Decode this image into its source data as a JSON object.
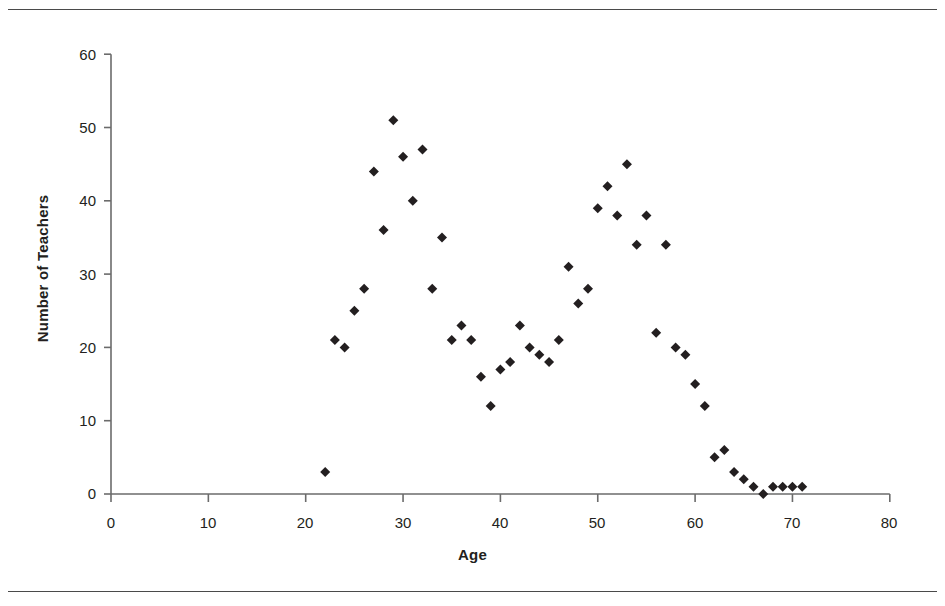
{
  "chart_data": {
    "type": "scatter",
    "title": "",
    "xlabel": "Age",
    "ylabel": "Number of Teachers",
    "xlim": [
      0,
      80
    ],
    "ylim": [
      0,
      60
    ],
    "xticks": [
      0,
      10,
      20,
      30,
      40,
      50,
      60,
      70,
      80
    ],
    "yticks": [
      0,
      10,
      20,
      30,
      40,
      50,
      60
    ],
    "grid": false,
    "legend": null,
    "marker": "diamond",
    "marker_color": "#231f20",
    "marker_size": 9,
    "series": [
      {
        "name": "Teachers",
        "x": [
          22,
          23,
          24,
          25,
          26,
          27,
          28,
          29,
          30,
          31,
          32,
          33,
          34,
          35,
          36,
          37,
          38,
          39,
          40,
          41,
          42,
          43,
          44,
          45,
          46,
          47,
          48,
          49,
          50,
          51,
          52,
          53,
          54,
          55,
          56,
          57,
          58,
          59,
          60,
          61,
          62,
          63,
          64,
          65,
          66,
          67,
          68,
          69,
          70,
          71
        ],
        "y": [
          3,
          21,
          20,
          25,
          28,
          44,
          36,
          51,
          46,
          40,
          47,
          28,
          35,
          21,
          23,
          21,
          16,
          12,
          17,
          18,
          23,
          20,
          19,
          18,
          21,
          31,
          26,
          28,
          39,
          42,
          38,
          45,
          34,
          38,
          22,
          34,
          20,
          19,
          15,
          12,
          5,
          6,
          3,
          2,
          1,
          0,
          1,
          1,
          1,
          1
        ]
      }
    ]
  },
  "axes": {
    "y_tick_labels": [
      "60",
      "50",
      "40",
      "30",
      "20",
      "10",
      "0"
    ],
    "x_tick_labels": [
      "0",
      "10",
      "20",
      "30",
      "40",
      "50",
      "60",
      "70",
      "80"
    ],
    "x_title": "Age",
    "y_title": "Number of Teachers"
  },
  "style": {
    "axis_color": "#6b6b6b",
    "marker_color": "#231f20",
    "rule_color": "#4a4a4a",
    "background": "#ffffff"
  }
}
